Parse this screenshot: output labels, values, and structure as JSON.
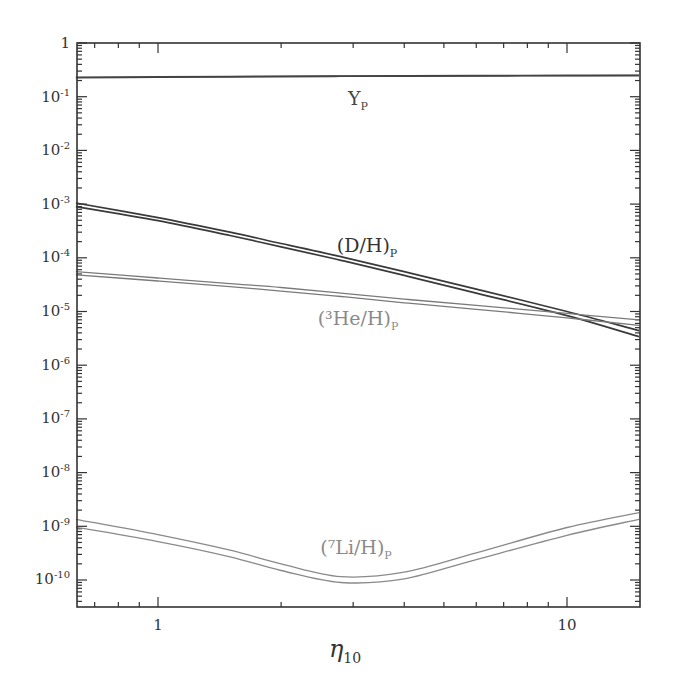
{
  "chart_data": {
    "type": "line",
    "title": "",
    "xlabel": "η10",
    "ylabel": "",
    "xscale": "log",
    "yscale": "log",
    "xlim": [
      0.63,
      15
    ],
    "ylim": [
      3e-11,
      1
    ],
    "grid": false,
    "legend": "inline labels",
    "x_ticks": [
      {
        "value": 1,
        "label": "1"
      },
      {
        "value": 10,
        "label": "10"
      }
    ],
    "y_ticks": [
      {
        "value": 1,
        "label": "1"
      },
      {
        "value": 0.1,
        "label": "10-1"
      },
      {
        "value": 0.01,
        "label": "10-2"
      },
      {
        "value": 0.001,
        "label": "10-3"
      },
      {
        "value": 0.0001,
        "label": "10-4"
      },
      {
        "value": 1e-05,
        "label": "10-5"
      },
      {
        "value": 1e-06,
        "label": "10-6"
      },
      {
        "value": 1e-07,
        "label": "10-7"
      },
      {
        "value": 1e-08,
        "label": "10-8"
      },
      {
        "value": 1e-09,
        "label": "10-9"
      },
      {
        "value": 1e-10,
        "label": "10-10"
      }
    ],
    "x": [
      0.63,
      1,
      1.5,
      2,
      2.8,
      4,
      6,
      10,
      15
    ],
    "series": [
      {
        "name": "Y_P",
        "label": "Y",
        "label_sub": "P",
        "color": "#444444",
        "upper": [
          0.23,
          0.235,
          0.238,
          0.241,
          0.243,
          0.245,
          0.247,
          0.249,
          0.25
        ],
        "lower": [
          0.225,
          0.23,
          0.234,
          0.237,
          0.24,
          0.242,
          0.244,
          0.246,
          0.247
        ]
      },
      {
        "name": "(D/H)_P",
        "label": "(D/H)",
        "label_sub": "P",
        "color": "#3a3a3a",
        "upper": [
          0.00105,
          0.00056,
          0.0003,
          0.000185,
          0.000105,
          5.5e-05,
          2.6e-05,
          1e-05,
          4.4e-06
        ],
        "lower": [
          0.0009,
          0.00049,
          0.00026,
          0.00016,
          9e-05,
          4.7e-05,
          2.2e-05,
          8.4e-06,
          3.4e-06
        ]
      },
      {
        "name": "(3He/H)_P",
        "label": "(³He/H)",
        "label_sub": "P",
        "color": "#777777",
        "upper": [
          5.5e-05,
          4.2e-05,
          3.3e-05,
          2.8e-05,
          2.2e-05,
          1.7e-05,
          1.3e-05,
          9.2e-06,
          7e-06
        ],
        "lower": [
          4.8e-05,
          3.7e-05,
          2.9e-05,
          2.4e-05,
          1.9e-05,
          1.45e-05,
          1.1e-05,
          7.6e-06,
          5.5e-06
        ]
      },
      {
        "name": "(7Li/H)_P",
        "label": "(⁷Li/H)",
        "label_sub": "P",
        "color": "#888888",
        "upper": [
          1.35e-09,
          7e-10,
          3.6e-10,
          2e-10,
          1.15e-10,
          1.4e-10,
          3.2e-10,
          9.5e-10,
          1.8e-09
        ],
        "lower": [
          9.6e-10,
          5.2e-10,
          2.7e-10,
          1.5e-10,
          9e-11,
          1.05e-10,
          2.4e-10,
          6.8e-10,
          1.35e-09
        ]
      }
    ],
    "annotations": [
      {
        "text": "Y_P",
        "x": 2.7,
        "y": 0.12
      },
      {
        "text": "(D/H)_P",
        "x": 3.3,
        "y": 8e-05
      },
      {
        "text": "(3He/H)_P",
        "x": 3.2,
        "y": 1.1e-05
      },
      {
        "text": "(7Li/H)_P",
        "x": 3.3,
        "y": 6e-10
      }
    ]
  },
  "labels": {
    "x_axis": "η",
    "x_axis_sub": "10",
    "x_tick_1": "1",
    "x_tick_10": "10",
    "y_ticks": [
      "1",
      "10",
      "10",
      "10",
      "10",
      "10",
      "10",
      "10",
      "10",
      "10",
      "10"
    ],
    "y_exps": [
      "",
      "-1",
      "-2",
      "-3",
      "-4",
      "-5",
      "-6",
      "-7",
      "-8",
      "-9",
      "-10"
    ],
    "yp": "Y",
    "yp_sub": "P",
    "dh": "(D/H)",
    "dh_sub": "P",
    "he3": "(³He/H)",
    "he3_sub": "P",
    "li7": "(⁷Li/H)",
    "li7_sub": "P"
  },
  "colors": {
    "axis": "#333333",
    "dh": "#3a3a3a",
    "yp": "#444444",
    "he3": "#7a7a7a",
    "li7": "#8a8a8a",
    "label_dark": "#333333",
    "label_light": "#8a8a8a"
  }
}
